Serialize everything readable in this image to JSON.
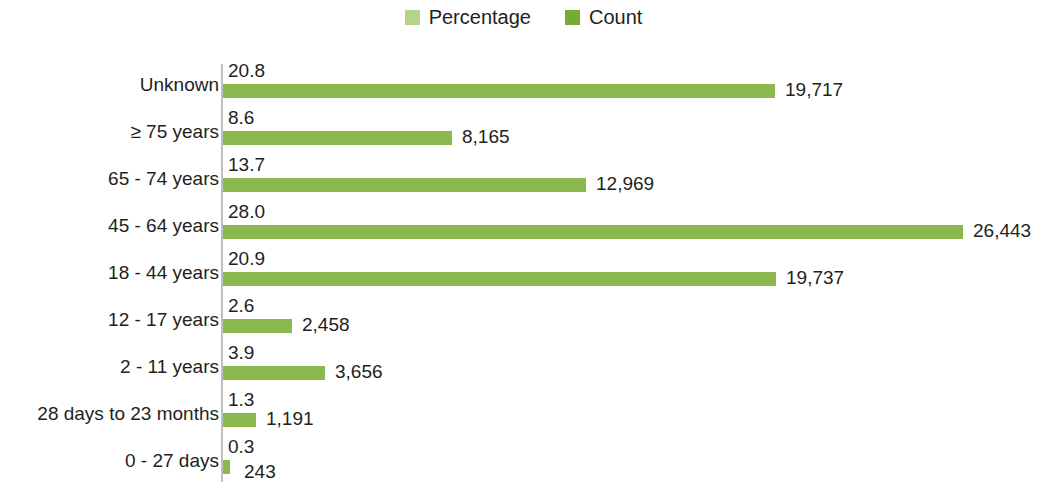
{
  "legend": {
    "entries": [
      {
        "label": "Percentage",
        "color": "#b5d489",
        "swatch_name": "legend-swatch-percentage"
      },
      {
        "label": "Count",
        "color": "#76a935",
        "swatch_name": "legend-swatch-count"
      }
    ]
  },
  "colors": {
    "bar": "#8cb94f",
    "percentage_swatch": "#b5d489",
    "count_swatch": "#76a935",
    "axis": "#bfbfbf",
    "text": "#231f20"
  },
  "chart_data": {
    "type": "bar",
    "orientation": "horizontal",
    "title": "",
    "xlabel": "",
    "ylabel": "",
    "grid": false,
    "legend_position": "top-center",
    "bar_value_series": "Count",
    "categories": [
      "Unknown",
      "≥ 75 years",
      "65 - 74 years",
      "45 - 64 years",
      "18 - 44 years",
      "12 - 17 years",
      "2 - 11 years",
      "28 days to 23 months",
      "0 - 27 days"
    ],
    "series": [
      {
        "name": "Percentage",
        "values": [
          20.8,
          8.6,
          13.7,
          28.0,
          20.9,
          2.6,
          3.9,
          1.3,
          0.3
        ],
        "labels": [
          "20.8",
          "8.6",
          "13.7",
          "28.0",
          "20.9",
          "2.6",
          "3.9",
          "1.3",
          "0.3"
        ]
      },
      {
        "name": "Count",
        "values": [
          19717,
          8165,
          12969,
          26443,
          19737,
          2458,
          3656,
          1191,
          243
        ],
        "labels": [
          "19,717",
          "8,165",
          "12,969",
          "26,443",
          "19,737",
          "2,458",
          "3,656",
          "1,191",
          "243"
        ]
      }
    ],
    "xlim": [
      0,
      26443
    ]
  },
  "rows": [
    {
      "category": "Unknown",
      "percent": "20.8",
      "count": "19,717",
      "bar_px": 552
    },
    {
      "category": "≥ 75 years",
      "percent": "8.6",
      "count": "8,165",
      "bar_px": 229
    },
    {
      "category": "65 - 74 years",
      "percent": "13.7",
      "count": "12,969",
      "bar_px": 363
    },
    {
      "category": "45 - 64 years",
      "percent": "28.0",
      "count": "26,443",
      "bar_px": 740
    },
    {
      "category": "18 - 44 years",
      "percent": "20.9",
      "count": "19,737",
      "bar_px": 553
    },
    {
      "category": "12 - 17 years",
      "percent": "2.6",
      "count": "2,458",
      "bar_px": 69
    },
    {
      "category": "2 - 11 years",
      "percent": "3.9",
      "count": "3,656",
      "bar_px": 102
    },
    {
      "category": "28 days to 23 months",
      "percent": "1.3",
      "count": "1,191",
      "bar_px": 33
    },
    {
      "category": "0 - 27 days",
      "percent": "0.3",
      "count": "243",
      "bar_px": 7
    }
  ]
}
